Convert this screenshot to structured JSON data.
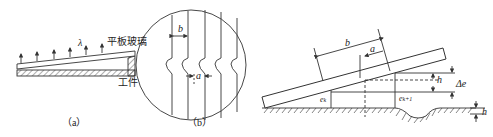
{
  "figure_a": {
    "caption": "（a）",
    "wavelength_label": "λ",
    "glass_label": "平板玻璃",
    "workpiece_label": "工件",
    "arrow_count": 6
  },
  "figure_b": {
    "caption": "（b）",
    "fringe_spacing_label": "b",
    "fringe_bend_label": "a"
  },
  "figure_c": {
    "fringe_spacing_label": "b",
    "bend_label": "a",
    "gap_left_label": "e",
    "gap_left_sub": "k",
    "gap_right_label": "e",
    "gap_right_sub": "k+1",
    "height_label": "h",
    "delta_label": "Δe",
    "defect_height_label": "h"
  },
  "colors": {
    "line": "#333333",
    "background": "#ffffff"
  }
}
